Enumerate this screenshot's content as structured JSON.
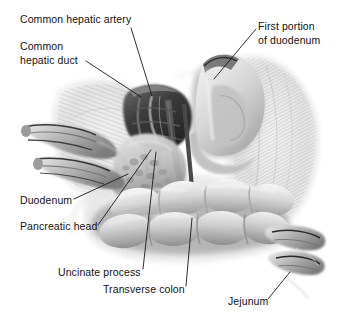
{
  "figure": {
    "background_color": "#ffffff",
    "ink_color": "#121212",
    "width": 338,
    "height": 323,
    "style": "grayscale airbrush medical illustration"
  },
  "labels": [
    {
      "id": "common-hepatic-artery",
      "text": "Common hepatic artery",
      "lines": [
        "Common hepatic artery"
      ],
      "x": 20,
      "y": 13
    },
    {
      "id": "common-hepatic-duct",
      "text": "Common hepatic duct",
      "lines": [
        "Common",
        "hepatic duct"
      ],
      "x": 20,
      "y": 40
    },
    {
      "id": "first-portion-of-duodenum",
      "text": "First portion of duodenum",
      "lines": [
        "First portion",
        "of duodenum"
      ],
      "x": 258,
      "y": 20
    },
    {
      "id": "duodenum",
      "text": "Duodenum",
      "lines": [
        "Duodenum"
      ],
      "x": 20,
      "y": 194
    },
    {
      "id": "pancreatic-head",
      "text": "Pancreatic head",
      "lines": [
        "Pancreatic head"
      ],
      "x": 20,
      "y": 220
    },
    {
      "id": "uncinate-process",
      "text": "Uncinate process",
      "lines": [
        "Uncinate process"
      ],
      "x": 58,
      "y": 266
    },
    {
      "id": "transverse-colon",
      "text": "Transverse colon",
      "lines": [
        "Transverse colon"
      ],
      "x": 103,
      "y": 283
    },
    {
      "id": "jejunum",
      "text": "Jejunum",
      "lines": [
        "Jejunum"
      ],
      "x": 228,
      "y": 295
    }
  ],
  "leader_lines": [
    {
      "id": "leader-common-hepatic-artery",
      "from": [
        131,
        28
      ],
      "to": [
        152,
        96
      ]
    },
    {
      "id": "leader-common-hepatic-duct",
      "from": [
        86,
        61
      ],
      "to": [
        141,
        97
      ]
    },
    {
      "id": "leader-first-portion-of-duodenum",
      "from": [
        256,
        29
      ],
      "to": [
        214,
        79
      ]
    },
    {
      "id": "leader-duodenum",
      "from": [
        74,
        199
      ],
      "to": [
        128,
        174
      ]
    },
    {
      "id": "leader-pancreatic-head",
      "from": [
        98,
        225
      ],
      "to": [
        151,
        150
      ]
    },
    {
      "id": "leader-uncinate-process",
      "from": [
        143,
        269
      ],
      "to": [
        156,
        152
      ]
    },
    {
      "id": "leader-transverse-colon",
      "from": [
        186,
        286
      ],
      "to": [
        192,
        218
      ]
    },
    {
      "id": "leader-jejunum",
      "from": [
        268,
        299
      ],
      "to": [
        290,
        272
      ]
    }
  ],
  "structures": [
    {
      "id": "hepatic-hilum",
      "name": "hepatic hilum with vessels",
      "tone": "#3a3a3a"
    },
    {
      "id": "first-duodenum",
      "name": "first portion of duodenum",
      "tone": "#c9c9c9"
    },
    {
      "id": "transverse-colon-body",
      "name": "transverse colon with haustra",
      "tone": "#bdbdbd"
    },
    {
      "id": "pancreatic-head-body",
      "name": "pancreatic head",
      "tone": "#b5b5b5"
    },
    {
      "id": "duodenal-stumps",
      "name": "cut duodenal stumps",
      "tone": "#9a9a9a"
    },
    {
      "id": "jejunal-stumps",
      "name": "cut jejunal ends",
      "tone": "#9a9a9a"
    },
    {
      "id": "mesentery",
      "name": "mesenteric / omental tissue",
      "tone": "#dcdcdc"
    }
  ]
}
